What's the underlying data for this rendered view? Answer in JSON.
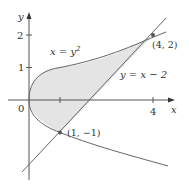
{
  "figure": {
    "axes": {
      "x_label": "x",
      "y_label": "y",
      "origin_label": "0",
      "x_ticks": [
        {
          "value": 1,
          "label": ""
        },
        {
          "value": 4,
          "label": "4"
        }
      ],
      "y_ticks": [
        {
          "value": 1,
          "label": "1"
        },
        {
          "value": 2,
          "label": "2"
        }
      ]
    },
    "curves": [
      {
        "name": "parabola",
        "equation_lhs": "x = y",
        "equation_exp": "2"
      },
      {
        "name": "line",
        "equation": "y = x − 2"
      }
    ],
    "points": [
      {
        "label": "(4, 2)",
        "x": 4,
        "y": 2
      },
      {
        "label": "(1, −1)",
        "x": 1,
        "y": -1
      }
    ],
    "colors": {
      "shade": "#e4e4e4",
      "curve": "#666666",
      "axis": "#555555",
      "text": "#333333"
    }
  }
}
